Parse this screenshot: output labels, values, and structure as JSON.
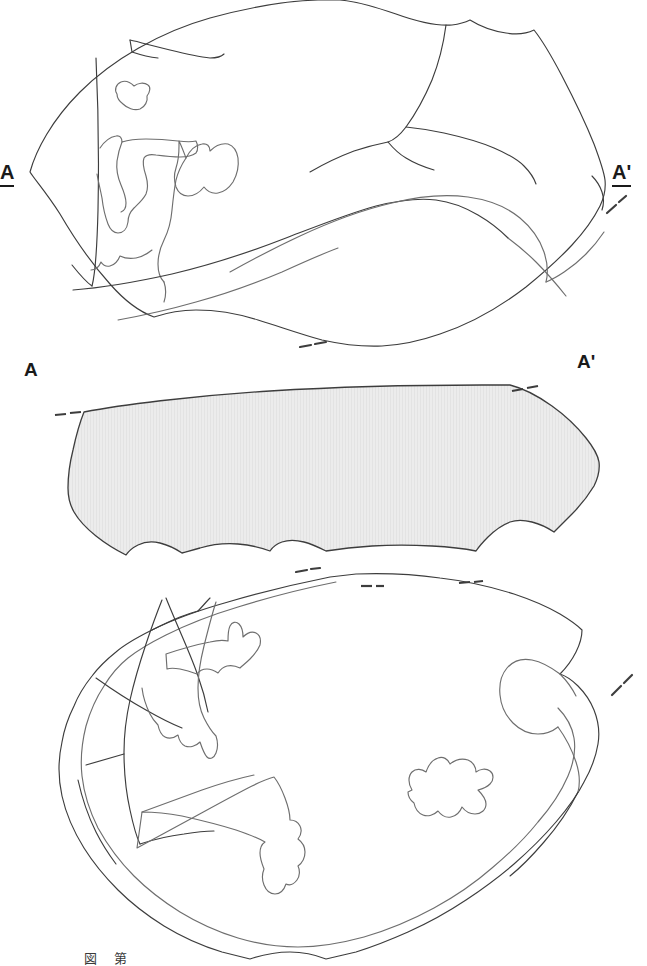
{
  "page": {
    "width": 647,
    "height": 966,
    "background": "#ffffff",
    "kind": "archaeological-artifact-illustration"
  },
  "style": {
    "outline_color": "#3d3d3d",
    "inner_line_color": "#6e6e6e",
    "section_fill": "#ececec",
    "label_color": "#1a1a1a",
    "caption_color": "#3a3a3a"
  },
  "section_labels": {
    "top_left": "A",
    "top_right": "A'",
    "middle_left": "A",
    "middle_right": "A'"
  },
  "figures": [
    {
      "id": "top-view",
      "name": "obverse-plan-view",
      "description": "Plan view of flaked stone artifact, obverse face, with section line A-A'",
      "has_section_line": true
    },
    {
      "id": "middle-section",
      "name": "cross-section-A-Aprime",
      "description": "Longitudinal cross-section along A-A', solid stipple fill",
      "fill": "#ececec"
    },
    {
      "id": "bottom-view",
      "name": "reverse-plan-view",
      "description": "Plan view of flaked stone artifact, reverse face",
      "has_section_line": true
    }
  ],
  "caption": {
    "figure_number": "図",
    "text": "第",
    "scale_note": ""
  }
}
